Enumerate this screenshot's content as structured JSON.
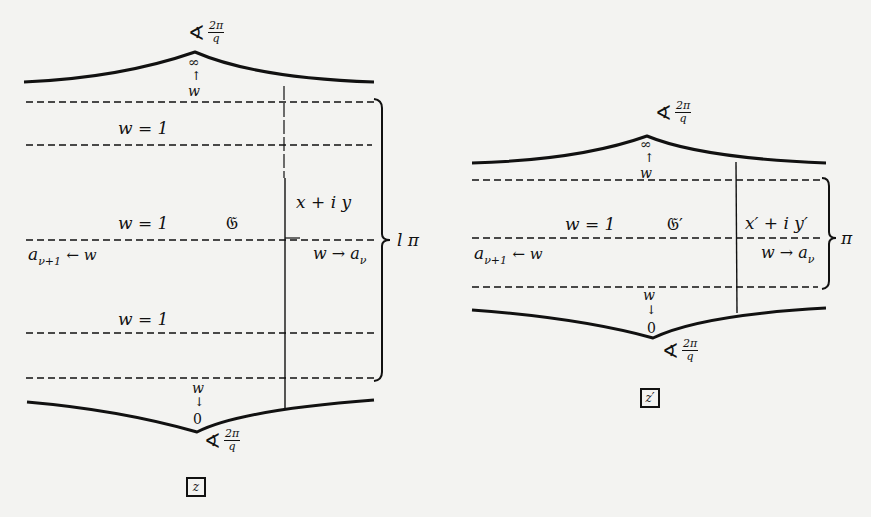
{
  "figure_left": {
    "top_angle": {
      "symbol": "∢",
      "numerator": "2π",
      "denominator": "q"
    },
    "top_point": "∞",
    "top_arrow": "↑",
    "top_w": "w",
    "strip_label_1": "w = 1",
    "domain_label": "𝔊",
    "point_label": "x + i y",
    "strip_label_2": "w = 1",
    "left_limit": {
      "a": "a",
      "sub": "ν+1",
      "arrow": "← w"
    },
    "right_limit": {
      "w": "w → a",
      "sub": "ν"
    },
    "strip_label_3": "w = 1",
    "brace_label": "l π",
    "bottom_w": "w",
    "bottom_arrow": "↓",
    "bottom_point": "0",
    "bottom_angle": {
      "symbol": "∢",
      "numerator": "2π",
      "denominator": "q"
    },
    "plane_label": "z"
  },
  "figure_right": {
    "top_angle": {
      "symbol": "∢",
      "numerator": "2π",
      "denominator": "q"
    },
    "top_point": "∞",
    "top_arrow": "↑",
    "top_w": "w",
    "strip_label": "w = 1",
    "domain_label": "𝔊′",
    "point_label": "x′ + i y′",
    "left_limit": {
      "a": "a",
      "sub": "ν+1",
      "arrow": "← w"
    },
    "right_limit": {
      "w": "w → a",
      "sub": "ν"
    },
    "brace_label": "π",
    "bottom_w": "w",
    "bottom_arrow": "↓",
    "bottom_point": "0",
    "bottom_angle": {
      "symbol": "∢",
      "numerator": "2π",
      "denominator": "q"
    },
    "plane_label": "z′"
  },
  "colors": {
    "ink": "#111111",
    "paper": "#f3f3f1",
    "bleed": "#c9c9c6"
  }
}
